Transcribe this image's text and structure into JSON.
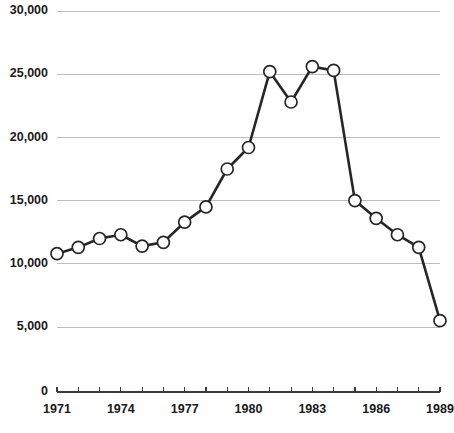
{
  "chart_data": {
    "type": "line",
    "title": "",
    "subtitle": "",
    "xlabel": "",
    "ylabel": "",
    "x": [
      1971,
      1972,
      1973,
      1974,
      1975,
      1976,
      1977,
      1978,
      1979,
      1980,
      1981,
      1982,
      1983,
      1984,
      1985,
      1986,
      1987,
      1988,
      1989
    ],
    "categories": [
      "1971",
      "1972",
      "1973",
      "1974",
      "1975",
      "1976",
      "1977",
      "1978",
      "1979",
      "1980",
      "1981",
      "1982",
      "1983",
      "1984",
      "1985",
      "1986",
      "1987",
      "1988",
      "1989"
    ],
    "values": [
      10800,
      11300,
      12000,
      12300,
      11400,
      11700,
      13300,
      14500,
      17500,
      19200,
      25200,
      22800,
      25600,
      25300,
      15000,
      13600,
      12300,
      11300,
      5500
    ],
    "series": [
      {
        "name": "",
        "values": [
          10800,
          11300,
          12000,
          12300,
          11400,
          11700,
          13300,
          14500,
          17500,
          19200,
          25200,
          22800,
          25600,
          25300,
          15000,
          13600,
          12300,
          11300,
          5500
        ]
      }
    ],
    "xlim": [
      1971,
      1989
    ],
    "ylim": [
      0,
      30000
    ],
    "ytick_values": [
      0,
      5000,
      10000,
      15000,
      20000,
      25000,
      30000
    ],
    "ytick_labels": [
      "0",
      "5,000",
      "10,000",
      "15,000",
      "20,000",
      "25,000",
      "30,000"
    ],
    "xtick_values": [
      1971,
      1972,
      1973,
      1974,
      1975,
      1976,
      1977,
      1978,
      1979,
      1980,
      1981,
      1982,
      1983,
      1984,
      1985,
      1986,
      1987,
      1988,
      1989
    ],
    "xtick_labels_shown": [
      "1971",
      "1974",
      "1977",
      "1980",
      "1983",
      "1986",
      "1989"
    ],
    "xtick_label_years": [
      1971,
      1974,
      1977,
      1980,
      1983,
      1986,
      1989
    ],
    "grid": {
      "horizontal": true,
      "vertical": false,
      "color": "#bdbdbd"
    },
    "legend": {
      "visible": false,
      "position": "none",
      "entries": []
    },
    "marker": {
      "shape": "circle",
      "fill": "#ffffff",
      "edge": "#262626",
      "radius": 6
    },
    "line_color": "#262626",
    "background": "#ffffff",
    "annotations": []
  },
  "axes": {
    "y_labels": [
      "30,000",
      "25,000",
      "20,000",
      "15,000",
      "10,000",
      "5,000",
      "0"
    ],
    "x_labels": [
      "1971",
      "1974",
      "1977",
      "1980",
      "1983",
      "1986",
      "1989"
    ]
  },
  "colors": {
    "line": "#262626",
    "grid": "#bdbdbd",
    "axis": "#3b3b3b",
    "text": "#1a1a1a",
    "marker_fill": "#ffffff",
    "background": "#ffffff"
  }
}
